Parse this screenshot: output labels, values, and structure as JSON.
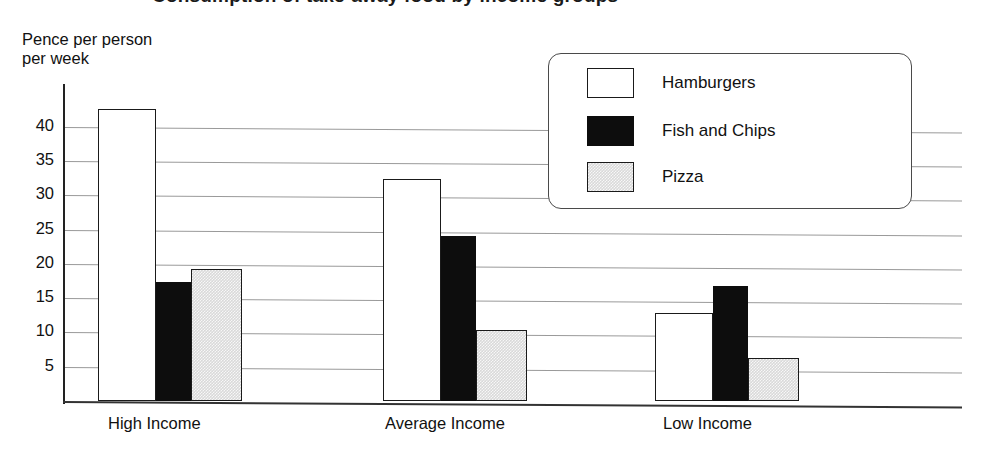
{
  "chart_data": {
    "type": "bar",
    "title": "Consumption of take-away food by income groups",
    "title_clipped": true,
    "ylabel": "Pence per person\nper week",
    "xlabel": "",
    "categories": [
      "High Income",
      "Average Income",
      "Low Income"
    ],
    "series": [
      {
        "name": "Hamburgers",
        "color": "#ffffff",
        "values": [
          42.5,
          32.3,
          12.8
        ]
      },
      {
        "name": "Fish and Chips",
        "color": "#0d0d0d",
        "values": [
          17.3,
          24.1,
          16.8
        ]
      },
      {
        "name": "Pizza",
        "color": "#d9d9d9",
        "values": [
          19.2,
          10.4,
          6.3
        ]
      }
    ],
    "ylim": [
      0,
      45
    ],
    "yticks": [
      5,
      10,
      15,
      20,
      25,
      30,
      35,
      40
    ],
    "ytick_labels": [
      "5",
      "10",
      "15",
      "20",
      "25",
      "30",
      "35",
      "40"
    ],
    "grid": true,
    "legend_position": "top-right"
  },
  "legend": {
    "items": [
      {
        "label": "Hamburgers"
      },
      {
        "label": "Fish and Chips"
      },
      {
        "label": "Pizza"
      }
    ]
  }
}
